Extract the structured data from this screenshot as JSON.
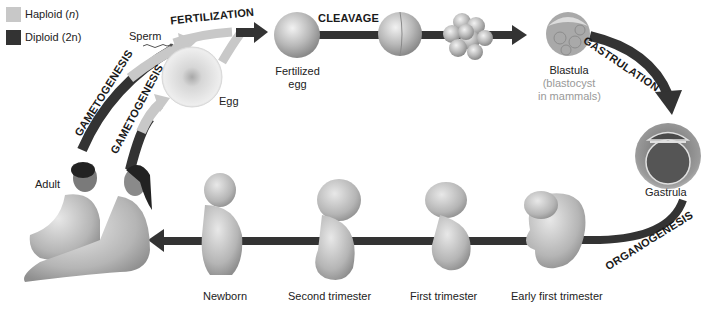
{
  "legend": {
    "items": [
      {
        "label": "Haploid",
        "symbol": "n",
        "color": "#c8c8c8"
      },
      {
        "label": "Diploid",
        "symbol": "2n",
        "color": "#333333"
      }
    ]
  },
  "colors": {
    "haploid": "#c8c8c8",
    "diploid": "#333333",
    "arrow_dark": "#333333",
    "muted_text": "#999999"
  },
  "processes": {
    "fertilization": "FERTILIZATION",
    "cleavage": "CLEAVAGE",
    "gastrulation": "GASTRULATION",
    "organogenesis": "ORGANOGENESIS",
    "gametogenesis_male": "GAMETOGENESIS",
    "gametogenesis_female": "GAMETOGENESIS"
  },
  "stages": {
    "sperm": "Sperm",
    "egg": "Egg",
    "fertilized_egg_line1": "Fertilized",
    "fertilized_egg_line2": "egg",
    "blastula": "Blastula",
    "blastula_note_line1": "(blastocyst",
    "blastula_note_line2": "in mammals)",
    "gastrula": "Gastrula",
    "early_first_trimester": "Early first trimester",
    "first_trimester": "First trimester",
    "second_trimester": "Second trimester",
    "newborn": "Newborn",
    "adult": "Adult"
  }
}
